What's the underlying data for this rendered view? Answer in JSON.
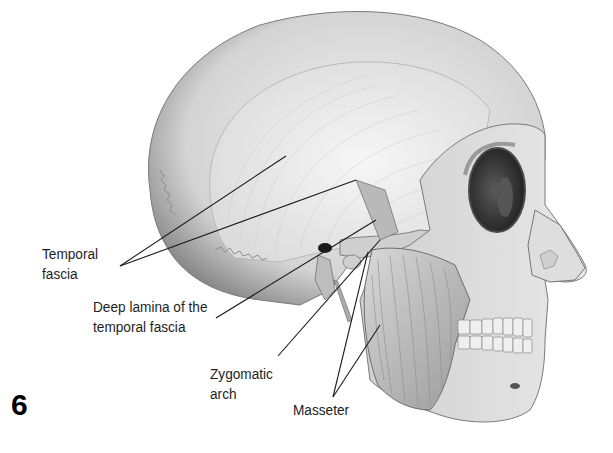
{
  "figure": {
    "number": "6",
    "labels": {
      "temporal_fascia": "Temporal\nfascia",
      "deep_lamina": "Deep lamina of the\ntemporal fascia",
      "zygomatic_arch": "Zygomatic\narch",
      "masseter": "Masseter"
    },
    "leader_lines": [
      {
        "label": "temporal_fascia",
        "from": [
          120,
          266
        ],
        "to": [
          286,
          156
        ]
      },
      {
        "label": "temporal_fascia",
        "from": [
          120,
          266
        ],
        "to": [
          356,
          180
        ]
      },
      {
        "label": "deep_lamina",
        "from": [
          216,
          318
        ],
        "to": [
          376,
          220
        ]
      },
      {
        "label": "zygomatic_arch",
        "from": [
          278,
          356
        ],
        "to": [
          380,
          240
        ]
      },
      {
        "label": "masseter",
        "from": [
          333,
          397
        ],
        "to": [
          368,
          252
        ]
      },
      {
        "label": "masseter",
        "from": [
          333,
          397
        ],
        "to": [
          380,
          325
        ]
      }
    ],
    "colors": {
      "background": "#ffffff",
      "bone": "#c9c9c9",
      "bone_shadow": "#8a8a8a",
      "fascia": "#e6e6e6",
      "muscle": "#b5b5b5",
      "line": "#1a1a1a",
      "text": "#1e1e1e"
    }
  }
}
